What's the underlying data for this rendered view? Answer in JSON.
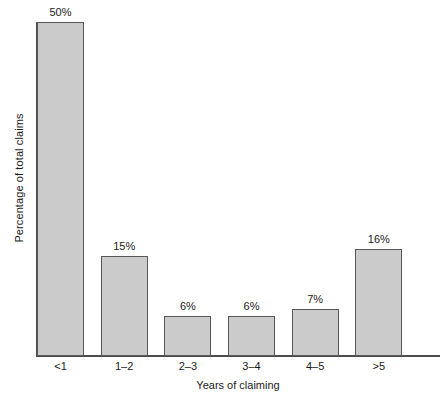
{
  "chart_data": {
    "type": "bar",
    "title": "",
    "subtitle": "",
    "categories": [
      "<1",
      "1–2",
      "2–3",
      "3–4",
      "4–5",
      ">5"
    ],
    "values": [
      50,
      15,
      6,
      6,
      7,
      16
    ],
    "data_labels": [
      "50%",
      "15%",
      "6%",
      "6%",
      "7%",
      "16%"
    ],
    "xlabel": "Years of claiming",
    "ylabel": "Percentage of total claims",
    "ylim": [
      0,
      50
    ],
    "ytick_labels": [],
    "grid": false,
    "legend": false,
    "legend_position": "none",
    "bar_fill_color": "#cbcbcb",
    "bar_edge_color": "#575757",
    "axis_color": "#4d4d4d",
    "background_color": "#ffffff",
    "annotations": []
  }
}
